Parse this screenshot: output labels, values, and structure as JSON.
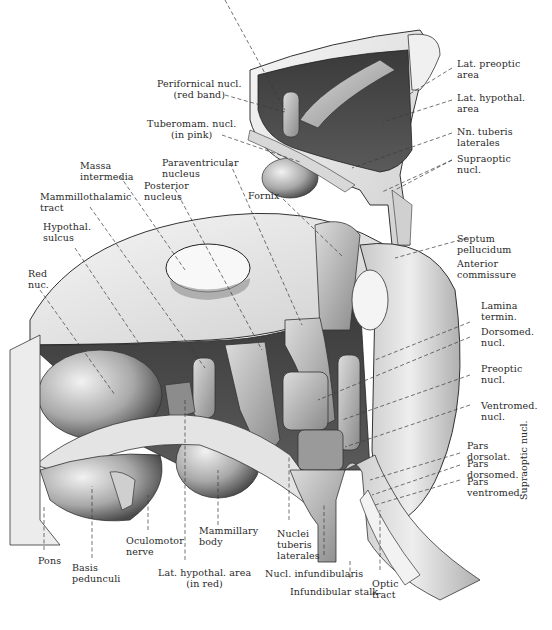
{
  "figure": {
    "colors": {
      "background": "#ffffff",
      "label_text": "#2a2a2a",
      "leader_line": "#3a3a3a",
      "tissue_light": "#e6e6e6",
      "tissue_mid": "#b8b8b8",
      "tissue_dark": "#555555",
      "cavity_dark": "#2e2e2e"
    }
  },
  "labels": {
    "perifornical": "Perifornical nucl.\n(red band)",
    "tuberomam": "Tuberomam. nucl.\n(in pink)",
    "lat_preoptic": "Lat. preoptic\narea",
    "lat_hypothal_top": "Lat. hypothal.\narea",
    "nn_tuberis": "Nn. tuberis\nlaterales",
    "supraoptic_top": "Supraoptic\nnucl.",
    "massa": "Massa\nintermedia",
    "paraventricular": "Paraventricular\nnucleus",
    "posterior": "Posterior\nnucleus",
    "mammillothalamic": "Mammillothalamic\ntract",
    "fornix": "Fornix",
    "hypothal_sulcus": "Hypothal.\nsulcus",
    "septum": "Septum\npellucidum",
    "red_nuc": "Red\nnuc.",
    "anterior_comm": "Anterior\ncommissure",
    "lamina": "Lamina\ntermin.",
    "dorsomed": "Dorsomed.\nnucl.",
    "preoptic": "Preoptic\nnucl.",
    "ventromed": "Ventromed.\nnucl.",
    "pars_dorsolat": "Pars\ndorsolat.",
    "pars_dorsomed": "Pars\ndorsomed.",
    "pars_ventromed": "Pars\nventromed.",
    "supraoptic_vertical": "Supraoptic nucl.",
    "pons": "Pons",
    "basis": "Basis\npedunculi",
    "oculomotor": "Oculomotor\nnerve",
    "mammillary": "Mammillary\nbody",
    "lat_hypothal_bottom": "Lat. hypothal. area\n(in red)",
    "nuclei_tuberis": "Nuclei\ntuberis\nlaterales",
    "nucl_infund": "Nucl. infundibularis",
    "infund_stalk": "Infundibular stalk",
    "optic_tract": "Optic\ntract"
  }
}
